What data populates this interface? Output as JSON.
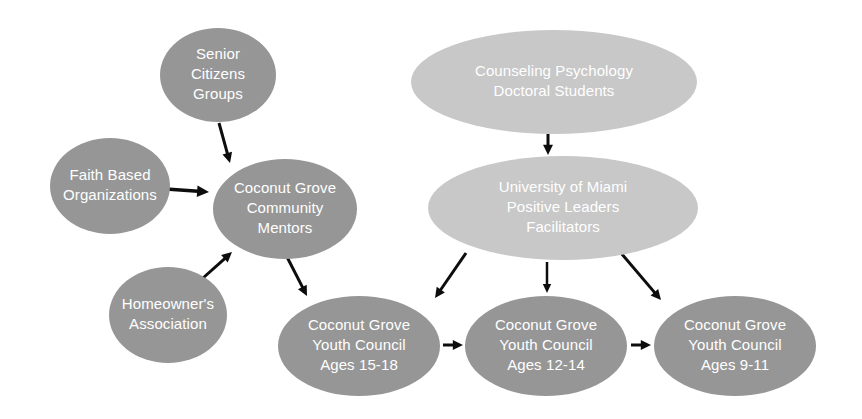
{
  "diagram": {
    "background_color": "#ffffff",
    "palette": {
      "node_medium_gray": "#969696",
      "node_light_gray": "#c8c8c8",
      "node_text": "#ffffff",
      "edge_color": "#0d0d0d"
    },
    "nodes": [
      {
        "id": "senior-citizens-groups",
        "lines": [
          "Senior",
          "Citizens",
          "Groups"
        ],
        "cx": 218,
        "cy": 75,
        "rx": 58,
        "ry": 47,
        "fill": "#969696",
        "font_size": 15
      },
      {
        "id": "faith-based-organizations",
        "lines": [
          "Faith Based",
          "Organizations"
        ],
        "cx": 110,
        "cy": 186,
        "rx": 60,
        "ry": 48,
        "fill": "#969696",
        "font_size": 15
      },
      {
        "id": "coconut-grove-community-mentors",
        "lines": [
          "Coconut Grove",
          "Community",
          "Mentors"
        ],
        "cx": 285,
        "cy": 209,
        "rx": 72,
        "ry": 50,
        "fill": "#969696",
        "font_size": 15
      },
      {
        "id": "homeowners-association",
        "lines": [
          "Homeowner's",
          "Association"
        ],
        "cx": 168,
        "cy": 315,
        "rx": 59,
        "ry": 48,
        "fill": "#969696",
        "font_size": 15
      },
      {
        "id": "counseling-psychology-doctoral-students",
        "lines": [
          "Counseling Psychology",
          "Doctoral Students"
        ],
        "cx": 554,
        "cy": 82,
        "rx": 143,
        "ry": 52,
        "fill": "#c8c8c8",
        "font_size": 15
      },
      {
        "id": "university-of-miami-positive-leaders-facilitators",
        "lines": [
          "University of Miami",
          "Positive Leaders",
          "Facilitators"
        ],
        "cx": 563,
        "cy": 208,
        "rx": 135,
        "ry": 52,
        "fill": "#c8c8c8",
        "font_size": 15
      },
      {
        "id": "coconut-grove-youth-council-15-18",
        "lines": [
          "Coconut Grove",
          "Youth Council",
          "Ages 15-18"
        ],
        "cx": 359,
        "cy": 346,
        "rx": 81,
        "ry": 50,
        "fill": "#969696",
        "font_size": 15
      },
      {
        "id": "coconut-grove-youth-council-12-14",
        "lines": [
          "Coconut Grove",
          "Youth Council",
          "Ages 12-14"
        ],
        "cx": 546,
        "cy": 346,
        "rx": 81,
        "ry": 50,
        "fill": "#969696",
        "font_size": 15
      },
      {
        "id": "coconut-grove-youth-council-9-11",
        "lines": [
          "Coconut Grove",
          "Youth Council",
          "Ages 9-11"
        ],
        "cx": 735,
        "cy": 346,
        "rx": 81,
        "ry": 50,
        "fill": "#969696",
        "font_size": 15
      }
    ],
    "edges": [
      {
        "id": "senior-citizens-to-mentors",
        "from": "senior-citizens-groups",
        "to": "coconut-grove-community-mentors",
        "x1": 219,
        "y1": 123,
        "x2": 230,
        "y2": 163,
        "width": 3
      },
      {
        "id": "faith-based-to-mentors",
        "from": "faith-based-organizations",
        "to": "coconut-grove-community-mentors",
        "x1": 166,
        "y1": 189,
        "x2": 209,
        "y2": 192,
        "width": 3.5
      },
      {
        "id": "homeowners-to-mentors",
        "from": "homeowners-association",
        "to": "coconut-grove-community-mentors",
        "x1": 203,
        "y1": 278,
        "x2": 232,
        "y2": 252,
        "width": 3
      },
      {
        "id": "mentors-to-youth-council-15-18",
        "from": "coconut-grove-community-mentors",
        "to": "coconut-grove-youth-council-15-18",
        "x1": 286,
        "y1": 255,
        "x2": 307,
        "y2": 296,
        "width": 3
      },
      {
        "id": "doctoral-students-to-facilitators",
        "from": "counseling-psychology-doctoral-students",
        "to": "university-of-miami-positive-leaders-facilitators",
        "x1": 548,
        "y1": 134,
        "x2": 548,
        "y2": 155,
        "width": 3
      },
      {
        "id": "facilitators-to-youth-council-15-18",
        "from": "university-of-miami-positive-leaders-facilitators",
        "to": "coconut-grove-youth-council-15-18",
        "x1": 466,
        "y1": 253,
        "x2": 435,
        "y2": 298,
        "width": 3
      },
      {
        "id": "facilitators-to-youth-council-12-14",
        "from": "university-of-miami-positive-leaders-facilitators",
        "to": "coconut-grove-youth-council-12-14",
        "x1": 547,
        "y1": 262,
        "x2": 547,
        "y2": 293,
        "width": 2.5
      },
      {
        "id": "facilitators-to-youth-council-9-11",
        "from": "university-of-miami-positive-leaders-facilitators",
        "to": "coconut-grove-youth-council-9-11",
        "x1": 621,
        "y1": 253,
        "x2": 661,
        "y2": 300,
        "width": 3
      },
      {
        "id": "youth-council-15-18-to-12-14",
        "from": "coconut-grove-youth-council-15-18",
        "to": "coconut-grove-youth-council-12-14",
        "x1": 443,
        "y1": 345,
        "x2": 463,
        "y2": 345,
        "width": 3
      },
      {
        "id": "youth-council-12-14-to-9-11",
        "from": "coconut-grove-youth-council-12-14",
        "to": "coconut-grove-youth-council-9-11",
        "x1": 631,
        "y1": 345,
        "x2": 651,
        "y2": 345,
        "width": 3
      }
    ]
  }
}
